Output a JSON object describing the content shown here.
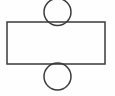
{
  "figure": {
    "canvas": {
      "width": 115,
      "height": 96,
      "background_color": "#fefefe"
    },
    "style": {
      "stroke_color": "#3a3a3a",
      "stroke_width": 1.5,
      "fill": "none"
    },
    "shapes": [
      {
        "name": "rectangle",
        "type": "rect",
        "x": 7,
        "y": 22,
        "width": 98,
        "height": 42,
        "stroke_color": "#3a3a3a",
        "stroke_width": 1.5,
        "fill": "none"
      },
      {
        "name": "top-circle",
        "type": "circle",
        "center_x": 57.5,
        "center_y": 12,
        "radius": 13.5,
        "diameter": 27,
        "stroke_color": "#3a3a3a",
        "stroke_width": 1.5,
        "fill": "none",
        "position": "above rectangle top edge, tangent at midpoint"
      },
      {
        "name": "bottom-circle",
        "type": "circle",
        "center_x": 57.5,
        "center_y": 76.5,
        "radius": 13.5,
        "diameter": 27,
        "stroke_color": "#3a3a3a",
        "stroke_width": 1.5,
        "fill": "none",
        "position": "below rectangle bottom edge, tangent at midpoint"
      }
    ],
    "labels": []
  }
}
